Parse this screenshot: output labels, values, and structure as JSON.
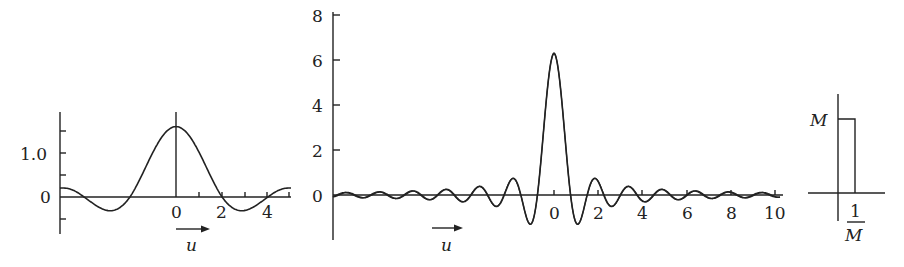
{
  "chart_data": [
    {
      "type": "line",
      "title": "",
      "xlabel": "u",
      "ylabel": "",
      "x_ticks": [
        "0",
        "2",
        "4"
      ],
      "y_ticks": [
        "0",
        "1.0"
      ],
      "xlim": [
        -5,
        5
      ],
      "ylim": [
        -0.8,
        1.9
      ],
      "series": [
        {
          "name": "smooth kernel",
          "description": "broad central lobe peaking ~1.6 at u=0, zeros near ±2 and ±4, shallow negative lobes ~-0.3"
        }
      ],
      "x": [
        -5,
        -4,
        -3,
        -2,
        -1,
        0,
        1,
        2,
        3,
        4,
        5
      ],
      "values": [
        0.25,
        0.0,
        -0.3,
        0.0,
        0.9,
        1.6,
        0.9,
        0.0,
        -0.28,
        0.0,
        0.2
      ]
    },
    {
      "type": "line",
      "title": "",
      "xlabel": "u",
      "ylabel": "",
      "x_ticks": [
        "0",
        "2",
        "4",
        "6",
        "8",
        "10"
      ],
      "y_ticks": [
        "0",
        "2",
        "4",
        "6",
        "8"
      ],
      "xlim": [
        -10,
        10
      ],
      "ylim": [
        -2,
        8
      ],
      "series": [
        {
          "name": "sinc-like kernel",
          "description": "narrow central peak ~6.3 at u=0, first minima ~-1.2, oscillating sidelobes decaying toward ±10"
        }
      ],
      "x": [
        -10,
        -4,
        -2,
        -1.2,
        -0.6,
        0,
        0.6,
        1.2,
        2,
        4,
        10
      ],
      "values": [
        0.05,
        0.15,
        0.4,
        0.9,
        -1.2,
        6.3,
        -1.2,
        0.9,
        0.4,
        0.15,
        0.05
      ]
    },
    {
      "type": "line",
      "title": "",
      "xlabel": "",
      "ylabel": "",
      "x_ticks": [
        "1/M"
      ],
      "y_ticks": [
        "M"
      ],
      "series": [
        {
          "name": "box function",
          "description": "rectangle of height M and width 1/M starting at origin"
        }
      ]
    }
  ],
  "labels": {
    "left": {
      "y_one": "1.0",
      "y_zero": "0",
      "x0": "0",
      "x2": "2",
      "x4": "4",
      "axis_var": "u"
    },
    "middle": {
      "y8": "8",
      "y6": "6",
      "y4": "4",
      "y2": "2",
      "y0": "0",
      "x0": "0",
      "x2": "2",
      "x4": "4",
      "x6": "6",
      "x8": "8",
      "x10": "10",
      "axis_var": "u"
    },
    "right": {
      "height": "M",
      "width_num": "1",
      "width_den": "M"
    }
  }
}
